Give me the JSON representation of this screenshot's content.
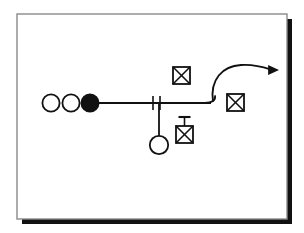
{
  "canvas": {
    "width": 304,
    "height": 233,
    "background": "#ffffff"
  },
  "frame": {
    "name": "diagram-frame",
    "x": 17,
    "y": 14,
    "width": 270,
    "height": 205,
    "fill": "#ffffff",
    "stroke": "#8a8a8a",
    "stroke_width": 1.4,
    "shadow_color": "#111111",
    "shadow_offset": 5,
    "shadow_thickness": 5
  },
  "style": {
    "ink": "#111111",
    "line_width": 1.8,
    "thin_line_width": 1.6,
    "fill_open": "#ffffff",
    "fill_solid": "#111111"
  },
  "diagram": {
    "type": "process-flow-schematic",
    "title": "",
    "nodes": [
      {
        "id": "circle-open-1",
        "name": "open-circle-left-1",
        "shape": "circle",
        "fill": "open",
        "cx": 51,
        "cy": 103,
        "r": 8.6,
        "label": ""
      },
      {
        "id": "circle-open-2",
        "name": "open-circle-left-2",
        "shape": "circle",
        "fill": "open",
        "cx": 71,
        "cy": 103,
        "r": 8.6,
        "label": ""
      },
      {
        "id": "circle-solid-1",
        "name": "solid-circle-left",
        "shape": "circle",
        "fill": "solid",
        "cx": 90,
        "cy": 103,
        "r": 8.6,
        "label": ""
      },
      {
        "id": "circle-open-3",
        "name": "open-circle-branch-bottom",
        "shape": "circle",
        "fill": "open",
        "cx": 159,
        "cy": 145,
        "r": 9.2,
        "label": ""
      },
      {
        "id": "crossed-box-upper",
        "name": "crossed-box-upper",
        "shape": "crossed-square",
        "x": 173,
        "y": 67,
        "size": 17,
        "stem": false,
        "label": ""
      },
      {
        "id": "crossed-box-right",
        "name": "crossed-box-right",
        "shape": "crossed-square",
        "x": 227,
        "y": 94,
        "size": 17,
        "stem": false,
        "label": ""
      },
      {
        "id": "crossed-box-lower",
        "name": "crossed-box-lower-with-stem",
        "shape": "crossed-square",
        "x": 176,
        "y": 126,
        "size": 17,
        "stem": true,
        "stem_height": 9,
        "stem_cap_width": 12,
        "label": ""
      }
    ],
    "edges": [
      {
        "id": "main-line",
        "name": "main-horizontal-line",
        "type": "line",
        "x1": 98,
        "y1": 103,
        "x2": 211,
        "y2": 103
      },
      {
        "id": "branch-line",
        "name": "branch-vertical-line",
        "type": "line",
        "x1": 159,
        "y1": 103,
        "x2": 159,
        "y2": 136
      }
    ],
    "marks": [
      {
        "id": "tick-1",
        "name": "slash-tick-mark-1",
        "type": "tick",
        "x": 153,
        "y_top": 96,
        "y_bottom": 110
      },
      {
        "id": "tick-2",
        "name": "slash-tick-mark-2",
        "type": "tick",
        "x": 160,
        "y_top": 96,
        "y_bottom": 110
      }
    ],
    "terminal": {
      "id": "line-end-curl",
      "name": "line-end-curl",
      "description": "small hook/loop at right end of main line",
      "path": "M 205 103 C 212 103 216 100 215 96"
    },
    "arrow": {
      "id": "outflow-arrow",
      "name": "curved-outflow-arrow",
      "direction": "right",
      "path": "M 213 101 C 210 80 222 66 241 65 C 256 64 266 68 272 70",
      "head_x": 279,
      "head_y": 70,
      "head_size": 7
    }
  }
}
